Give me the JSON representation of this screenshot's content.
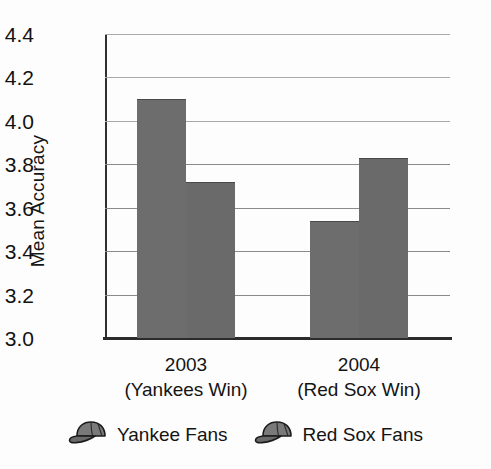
{
  "chart_data": {
    "type": "bar",
    "title": "",
    "xlabel": "",
    "ylabel": "Mean Accuracy",
    "ylim": [
      3.0,
      4.4
    ],
    "ytick_labels": [
      "4.4",
      "4.2",
      "4.0",
      "3.8",
      "3.6",
      "3.4",
      "3.2",
      "3.0"
    ],
    "ytick_values": [
      4.4,
      4.2,
      4.0,
      3.8,
      3.6,
      3.4,
      3.2,
      3.0
    ],
    "grid": true,
    "legend_position": "bottom",
    "categories": [
      "2003\n(Yankees Win)",
      "2004\n(Red Sox Win)"
    ],
    "category_lines": [
      {
        "year": "2003",
        "sub": "(Yankees Win)"
      },
      {
        "year": "2004",
        "sub": "(Red Sox Win)"
      }
    ],
    "series": [
      {
        "name": "Yankee Fans",
        "values": [
          4.1,
          3.54
        ],
        "color": "#6d6d6d"
      },
      {
        "name": "Red Sox Fans",
        "values": [
          3.72,
          3.83
        ],
        "color": "#6a6a6a"
      }
    ],
    "bars": [
      {
        "group": "2003",
        "series": "Yankee Fans",
        "value": 4.1
      },
      {
        "group": "2003",
        "series": "Red Sox Fans",
        "value": 3.72
      },
      {
        "group": "2004",
        "series": "Yankee Fans",
        "value": 3.54
      },
      {
        "group": "2004",
        "series": "Red Sox Fans",
        "value": 3.83
      }
    ]
  },
  "legend": {
    "items": [
      {
        "label": "Yankee Fans",
        "icon": "baseball-cap-icon"
      },
      {
        "label": "Red Sox Fans",
        "icon": "baseball-cap-icon"
      }
    ]
  },
  "colors": {
    "bar_fill": "#6d6d6d",
    "axis": "#2b2b2b",
    "gridline": "#8b8b8b",
    "text": "#141414",
    "background": "#fdfdfd"
  }
}
